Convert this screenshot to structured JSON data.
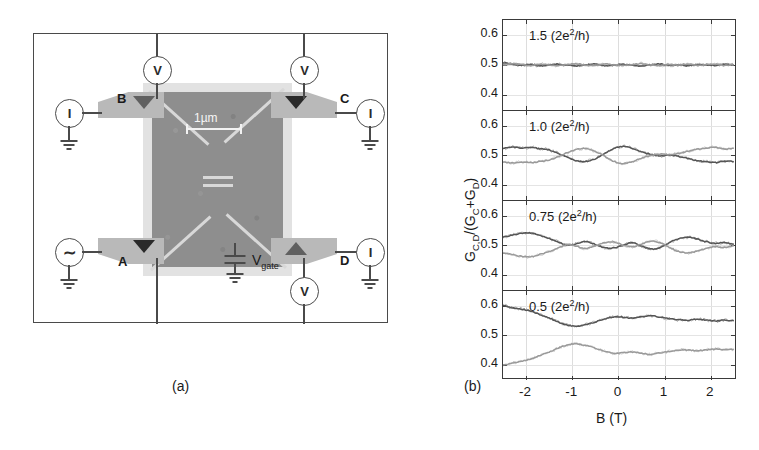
{
  "figure": {
    "subcaption_a": "(a)",
    "subcaption_b": "(b)"
  },
  "panel_a": {
    "title": "four-terminal quantum dot device schematic",
    "terminals": [
      {
        "id": "B",
        "label": "B",
        "position": "top-left"
      },
      {
        "id": "C",
        "label": "C",
        "position": "top-right"
      },
      {
        "id": "A",
        "label": "A",
        "position": "bottom-left"
      },
      {
        "id": "D",
        "label": "D",
        "position": "bottom-right"
      }
    ],
    "meters": [
      {
        "id": "v-top-left",
        "label": "V",
        "type": "voltmeter"
      },
      {
        "id": "v-top-right",
        "label": "V",
        "type": "voltmeter"
      },
      {
        "id": "i-left",
        "label": "I",
        "type": "ammeter"
      },
      {
        "id": "i-right",
        "label": "I",
        "type": "ammeter"
      },
      {
        "id": "i-bottom-right",
        "label": "I",
        "type": "ammeter"
      },
      {
        "id": "v-bottom-right",
        "label": "V",
        "type": "voltmeter"
      }
    ],
    "ac_source": {
      "symbol": "∼",
      "label": "AC current source"
    },
    "gate": {
      "label": "V",
      "subscript": "gate"
    },
    "scale_bar": {
      "label": "1µm",
      "length_um": 1
    },
    "colors": {
      "sem_background": "#8e8e8e",
      "sem_halo": "#e2e2e2",
      "gate_lines": "#d8d8d8",
      "contact_pads": "#b9b9b9",
      "wires": "#4a4a4a"
    }
  },
  "chart_data": {
    "type": "line",
    "title": "",
    "xlabel": "B (T)",
    "ylabel": "G_C,D/(G_C+G_D)",
    "ylabel_parts": {
      "main": "G",
      "sub1": "C,D",
      "mid": "/(G",
      "sub2": "C",
      "plus": "+G",
      "sub3": "D",
      "close": ")"
    },
    "xlim": [
      -2.5,
      2.5
    ],
    "ylim": [
      0.35,
      0.65
    ],
    "xticks": [
      -2,
      -1,
      0,
      1,
      2
    ],
    "xticklabels": [
      "-2",
      "-1",
      "0",
      "1",
      "2"
    ],
    "yticks": [
      0.4,
      0.5,
      0.6
    ],
    "yticklabels": [
      "0.4",
      "0.5",
      "0.6"
    ],
    "grid": true,
    "legend": "none",
    "series_colors": {
      "G_C": "#555555",
      "G_D": "#9a9a9a"
    },
    "panels": [
      {
        "annotation": "1.5 (2e2/h)",
        "annotation_value": "1.5",
        "annotation_unit_pre": " (2e",
        "annotation_sup": "2",
        "annotation_unit_post": "/h)",
        "x": [
          -2.5,
          -2.3,
          -2.1,
          -1.9,
          -1.7,
          -1.5,
          -1.3,
          -1.1,
          -0.9,
          -0.7,
          -0.5,
          -0.3,
          -0.1,
          0.1,
          0.3,
          0.5,
          0.7,
          0.9,
          1.1,
          1.3,
          1.5,
          1.7,
          1.9,
          2.1,
          2.3,
          2.5
        ],
        "series": [
          {
            "name": "G_C",
            "values": [
              0.508,
              0.503,
              0.5,
              0.502,
              0.497,
              0.5,
              0.503,
              0.499,
              0.497,
              0.501,
              0.503,
              0.498,
              0.5,
              0.502,
              0.499,
              0.497,
              0.501,
              0.503,
              0.499,
              0.501,
              0.498,
              0.502,
              0.5,
              0.499,
              0.502,
              0.5
            ]
          },
          {
            "name": "G_D",
            "values": [
              0.5,
              0.505,
              0.502,
              0.498,
              0.503,
              0.5,
              0.498,
              0.502,
              0.504,
              0.499,
              0.498,
              0.503,
              0.501,
              0.498,
              0.502,
              0.504,
              0.5,
              0.498,
              0.502,
              0.5,
              0.503,
              0.499,
              0.501,
              0.503,
              0.499,
              0.501
            ]
          }
        ]
      },
      {
        "annotation": "1.0 (2e2/h)",
        "annotation_value": "1.0",
        "annotation_unit_pre": " (2e",
        "annotation_sup": "2",
        "annotation_unit_post": "/h)",
        "x": [
          -2.5,
          -2.3,
          -2.1,
          -1.9,
          -1.7,
          -1.5,
          -1.3,
          -1.1,
          -0.9,
          -0.7,
          -0.5,
          -0.3,
          -0.1,
          0.1,
          0.3,
          0.5,
          0.7,
          0.9,
          1.1,
          1.3,
          1.5,
          1.7,
          1.9,
          2.1,
          2.3,
          2.5
        ],
        "series": [
          {
            "name": "G_C",
            "values": [
              0.523,
              0.528,
              0.524,
              0.527,
              0.522,
              0.518,
              0.506,
              0.492,
              0.481,
              0.479,
              0.488,
              0.505,
              0.523,
              0.53,
              0.524,
              0.512,
              0.503,
              0.498,
              0.5,
              0.496,
              0.489,
              0.482,
              0.478,
              0.475,
              0.48,
              0.478
            ]
          },
          {
            "name": "G_D",
            "values": [
              0.478,
              0.474,
              0.477,
              0.475,
              0.479,
              0.484,
              0.495,
              0.509,
              0.52,
              0.522,
              0.513,
              0.497,
              0.479,
              0.472,
              0.478,
              0.49,
              0.499,
              0.504,
              0.502,
              0.506,
              0.513,
              0.52,
              0.524,
              0.527,
              0.521,
              0.524
            ]
          }
        ]
      },
      {
        "annotation": "0.75 (2e2/h)",
        "annotation_value": "0.75",
        "annotation_unit_pre": " (2e",
        "annotation_sup": "2",
        "annotation_unit_post": "/h)",
        "x": [
          -2.5,
          -2.3,
          -2.1,
          -1.9,
          -1.7,
          -1.5,
          -1.3,
          -1.1,
          -0.9,
          -0.7,
          -0.5,
          -0.3,
          -0.1,
          0.1,
          0.3,
          0.5,
          0.7,
          0.9,
          1.1,
          1.3,
          1.5,
          1.7,
          1.9,
          2.1,
          2.3,
          2.5
        ],
        "series": [
          {
            "name": "G_C",
            "values": [
              0.528,
              0.534,
              0.54,
              0.541,
              0.533,
              0.523,
              0.51,
              0.5,
              0.505,
              0.512,
              0.503,
              0.492,
              0.49,
              0.5,
              0.508,
              0.497,
              0.487,
              0.492,
              0.508,
              0.522,
              0.527,
              0.521,
              0.512,
              0.506,
              0.509,
              0.503
            ]
          },
          {
            "name": "G_D",
            "values": [
              0.473,
              0.468,
              0.462,
              0.461,
              0.469,
              0.478,
              0.491,
              0.502,
              0.496,
              0.489,
              0.498,
              0.509,
              0.511,
              0.501,
              0.494,
              0.504,
              0.514,
              0.509,
              0.493,
              0.479,
              0.474,
              0.48,
              0.489,
              0.495,
              0.492,
              0.498
            ]
          }
        ]
      },
      {
        "annotation": "0.5 (2e2/h)",
        "annotation_value": "0.5",
        "annotation_unit_pre": " (2e",
        "annotation_sup": "2",
        "annotation_unit_post": "/h)",
        "x": [
          -2.5,
          -2.3,
          -2.1,
          -1.9,
          -1.7,
          -1.5,
          -1.3,
          -1.1,
          -0.9,
          -0.7,
          -0.5,
          -0.3,
          -0.1,
          0.1,
          0.3,
          0.5,
          0.7,
          0.9,
          1.1,
          1.3,
          1.5,
          1.7,
          1.9,
          2.1,
          2.3,
          2.5
        ],
        "series": [
          {
            "name": "G_C",
            "values": [
              0.601,
              0.593,
              0.588,
              0.582,
              0.57,
              0.558,
              0.545,
              0.534,
              0.531,
              0.536,
              0.545,
              0.556,
              0.562,
              0.561,
              0.558,
              0.563,
              0.566,
              0.561,
              0.556,
              0.552,
              0.551,
              0.554,
              0.551,
              0.548,
              0.551,
              0.549
            ]
          },
          {
            "name": "G_D",
            "values": [
              0.399,
              0.406,
              0.412,
              0.419,
              0.431,
              0.443,
              0.456,
              0.467,
              0.47,
              0.465,
              0.456,
              0.445,
              0.439,
              0.44,
              0.443,
              0.438,
              0.435,
              0.44,
              0.445,
              0.449,
              0.45,
              0.447,
              0.45,
              0.453,
              0.45,
              0.452
            ]
          }
        ]
      }
    ]
  }
}
